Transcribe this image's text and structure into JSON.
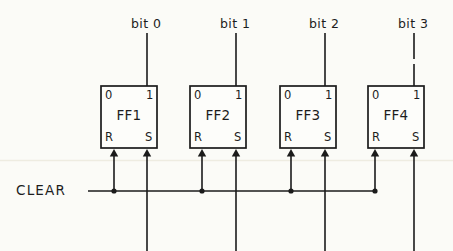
{
  "diagram": {
    "style": "hand-drawn",
    "background_color": "#fbfbf7",
    "ink_color": "#1b1b1b",
    "clear_bus": {
      "label": "CLEAR",
      "label_x": 16,
      "label_y": 184,
      "line_y": 191,
      "line_start_x": 88,
      "line_end_x": 375
    },
    "flipflops": [
      {
        "name": "FF1",
        "bit_label": "bit 0",
        "bit_label_x": 131,
        "bit_label_y": 18,
        "box_x": 101,
        "box_y": 86,
        "box_w": 56,
        "box_h": 62,
        "port_top_left": "0",
        "port_top_right": "1",
        "port_bottom_left": "R",
        "port_bottom_right": "S",
        "bit_line_x": 147,
        "reset_line_x": 114,
        "set_line_x": 147,
        "clear_tap_x": 114,
        "bit_line_dashed": false
      },
      {
        "name": "FF2",
        "bit_label": "bit 1",
        "bit_label_x": 220,
        "bit_label_y": 18,
        "box_x": 190,
        "box_y": 86,
        "box_w": 56,
        "box_h": 62,
        "port_top_left": "0",
        "port_top_right": "1",
        "port_bottom_left": "R",
        "port_bottom_right": "S",
        "bit_line_x": 236,
        "reset_line_x": 202,
        "set_line_x": 236,
        "clear_tap_x": 202,
        "bit_line_dashed": false
      },
      {
        "name": "FF3",
        "bit_label": "bit 2",
        "bit_label_x": 309,
        "bit_label_y": 18,
        "box_x": 280,
        "box_y": 86,
        "box_w": 56,
        "box_h": 62,
        "port_top_left": "0",
        "port_top_right": "1",
        "port_bottom_left": "R",
        "port_bottom_right": "S",
        "bit_line_x": 325,
        "reset_line_x": 291,
        "set_line_x": 325,
        "clear_tap_x": 291,
        "bit_line_dashed": false
      },
      {
        "name": "FF4",
        "bit_label": "bit 3",
        "bit_label_x": 398,
        "bit_label_y": 18,
        "box_x": 368,
        "box_y": 86,
        "box_w": 56,
        "box_h": 62,
        "port_top_left": "0",
        "port_top_right": "1",
        "port_bottom_left": "R",
        "port_bottom_right": "S",
        "bit_line_x": 414,
        "reset_line_x": 375,
        "set_line_x": 414,
        "clear_tap_x": 375,
        "bit_line_dashed": true
      }
    ]
  }
}
